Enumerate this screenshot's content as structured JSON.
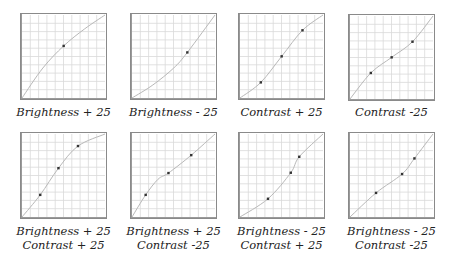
{
  "chart_data": [
    {
      "type": "line",
      "title": "Brightness + 25",
      "label_lines": [
        "Brightness + 25"
      ],
      "xlim": [
        0,
        255
      ],
      "ylim": [
        0,
        255
      ],
      "grid": true,
      "grid_divisions": 10,
      "control_points": [
        [
          128,
          160
        ]
      ],
      "curve": [
        [
          0,
          0
        ],
        [
          64,
          92
        ],
        [
          128,
          160
        ],
        [
          192,
          212
        ],
        [
          255,
          255
        ]
      ]
    },
    {
      "type": "line",
      "title": "Brightness - 25",
      "label_lines": [
        "Brightness - 25"
      ],
      "xlim": [
        0,
        255
      ],
      "ylim": [
        0,
        255
      ],
      "grid": true,
      "grid_divisions": 10,
      "control_points": [
        [
          170,
          140
        ]
      ],
      "curve": [
        [
          0,
          0
        ],
        [
          64,
          40
        ],
        [
          128,
          92
        ],
        [
          170,
          140
        ],
        [
          255,
          255
        ]
      ]
    },
    {
      "type": "line",
      "title": "Contrast + 25",
      "label_lines": [
        "Contrast + 25"
      ],
      "xlim": [
        0,
        255
      ],
      "ylim": [
        0,
        255
      ],
      "grid": true,
      "grid_divisions": 10,
      "control_points": [
        [
          64,
          48
        ],
        [
          128,
          128
        ],
        [
          192,
          208
        ]
      ],
      "curve": [
        [
          0,
          0
        ],
        [
          64,
          48
        ],
        [
          128,
          128
        ],
        [
          192,
          208
        ],
        [
          255,
          255
        ]
      ]
    },
    {
      "type": "line",
      "title": "Contrast -25",
      "label_lines": [
        "Contrast -25"
      ],
      "xlim": [
        0,
        255
      ],
      "ylim": [
        0,
        255
      ],
      "grid": true,
      "grid_divisions": 10,
      "control_points": [
        [
          64,
          80
        ],
        [
          128,
          128
        ],
        [
          192,
          176
        ]
      ],
      "curve": [
        [
          0,
          0
        ],
        [
          64,
          80
        ],
        [
          128,
          128
        ],
        [
          192,
          176
        ],
        [
          255,
          255
        ]
      ]
    },
    {
      "type": "line",
      "title": "Brightness + 25 / Contrast + 25",
      "label_lines": [
        "Brightness + 25",
        "Contrast + 25"
      ],
      "xlim": [
        0,
        255
      ],
      "ylim": [
        0,
        255
      ],
      "grid": true,
      "grid_divisions": 10,
      "control_points": [
        [
          56,
          68
        ],
        [
          112,
          150
        ],
        [
          172,
          218
        ]
      ],
      "curve": [
        [
          0,
          0
        ],
        [
          56,
          68
        ],
        [
          112,
          150
        ],
        [
          172,
          218
        ],
        [
          255,
          255
        ]
      ]
    },
    {
      "type": "line",
      "title": "Brightness + 25 / Contrast -25",
      "label_lines": [
        "Brightness + 25",
        "Contrast -25"
      ],
      "xlim": [
        0,
        255
      ],
      "ylim": [
        0,
        255
      ],
      "grid": true,
      "grid_divisions": 10,
      "control_points": [
        [
          42,
          68
        ],
        [
          112,
          135
        ],
        [
          182,
          190
        ]
      ],
      "curve": [
        [
          0,
          0
        ],
        [
          42,
          68
        ],
        [
          80,
          116
        ],
        [
          112,
          135
        ],
        [
          182,
          190
        ],
        [
          255,
          255
        ]
      ]
    },
    {
      "type": "line",
      "title": "Brightness - 25 / Contrast + 25",
      "label_lines": [
        "Brightness - 25",
        "Contrast + 25"
      ],
      "xlim": [
        0,
        255
      ],
      "ylim": [
        0,
        255
      ],
      "grid": true,
      "grid_divisions": 10,
      "control_points": [
        [
          86,
          56
        ],
        [
          156,
          136
        ],
        [
          182,
          185
        ]
      ],
      "curve": [
        [
          0,
          0
        ],
        [
          86,
          56
        ],
        [
          156,
          136
        ],
        [
          182,
          185
        ],
        [
          255,
          255
        ]
      ]
    },
    {
      "type": "line",
      "title": "Brightness - 25 / Contrast -25",
      "label_lines": [
        "Brightness - 25",
        "Contrast -25"
      ],
      "xlim": [
        0,
        255
      ],
      "ylim": [
        0,
        255
      ],
      "grid": true,
      "grid_divisions": 10,
      "control_points": [
        [
          80,
          74
        ],
        [
          160,
          132
        ],
        [
          198,
          180
        ]
      ],
      "curve": [
        [
          0,
          0
        ],
        [
          80,
          74
        ],
        [
          160,
          132
        ],
        [
          198,
          180
        ],
        [
          255,
          255
        ]
      ]
    }
  ],
  "panels": [
    {
      "line1": "Brightness + 25",
      "line2": ""
    },
    {
      "line1": "Brightness - 25",
      "line2": ""
    },
    {
      "line1": "Contrast + 25",
      "line2": ""
    },
    {
      "line1": "Contrast -25",
      "line2": ""
    },
    {
      "line1": "Brightness + 25",
      "line2": "Contrast + 25"
    },
    {
      "line1": "Brightness + 25",
      "line2": "Contrast -25"
    },
    {
      "line1": "Brightness - 25",
      "line2": "Contrast + 25"
    },
    {
      "line1": "Brightness - 25",
      "line2": "Contrast -25"
    }
  ],
  "colors": {
    "grid": "#d9d9d9",
    "border": "#8a8a8a",
    "curve": "#b8b8b8",
    "point": "#333333",
    "label": "#222222"
  }
}
